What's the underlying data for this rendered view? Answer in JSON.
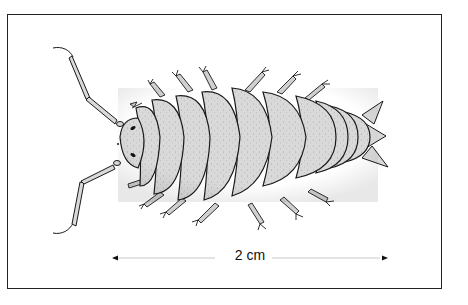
{
  "figure": {
    "scale_bar": {
      "label": "2 cm",
      "length_px": 272
    },
    "colors": {
      "body_fill": "#d9d9d9",
      "outline": "#1a1a1a",
      "background": "#ffffff",
      "frame": "#222222"
    },
    "segments": 12,
    "legs_per_side": 7
  }
}
